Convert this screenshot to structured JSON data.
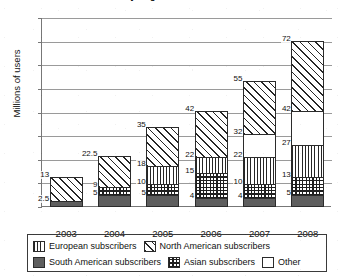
{
  "chart_data": {
    "type": "bar",
    "subtype": "stacked-bar",
    "title": "by Region 2003–2007",
    "xlabel": "",
    "ylabel": "Millions of users",
    "ylim": [
      0,
      80
    ],
    "ytick_step": 10,
    "ytick_labels": [
      "80",
      "70",
      "60",
      "50",
      "40",
      "30",
      "20",
      "10",
      "0"
    ],
    "grid": true,
    "legend_position": "bottom",
    "categories": [
      "2003",
      "2004",
      "2005",
      "2006",
      "2007",
      "2008"
    ],
    "series": [
      {
        "name": "South American subscribers",
        "pattern": "solid-dark-gray",
        "values": [
          2.5,
          5,
          5,
          4,
          4,
          5
        ]
      },
      {
        "name": "Asian subscribers",
        "pattern": "checkered",
        "values": [
          0,
          4,
          5,
          11,
          6,
          8
        ]
      },
      {
        "name": "European subscribers",
        "pattern": "vertical-stripes",
        "values": [
          0,
          0,
          8,
          7,
          12,
          14
        ]
      },
      {
        "name": "Other",
        "pattern": "white",
        "values": [
          0,
          0,
          0,
          0,
          10,
          15
        ]
      },
      {
        "name": "North American subscribers",
        "pattern": "diagonal-stripes",
        "values": [
          10.5,
          13.5,
          17,
          20,
          23,
          30
        ]
      }
    ],
    "cumulative_labels": [
      [
        "2.5",
        "13"
      ],
      [
        "5",
        "9",
        "22.5"
      ],
      [
        "5",
        "10",
        "18",
        "35"
      ],
      [
        "4",
        "15",
        "22",
        "42"
      ],
      [
        "4",
        "10",
        "22",
        "32",
        "55"
      ],
      [
        "5",
        "13",
        "27",
        "42",
        "72"
      ]
    ],
    "totals": [
      13,
      22.5,
      35,
      42,
      55,
      72
    ]
  },
  "legend": {
    "row1": [
      {
        "label": "European subscribers",
        "pattern": "vertical-stripes"
      },
      {
        "label": "North American subscribers",
        "pattern": "diagonal-stripes"
      }
    ],
    "row2": [
      {
        "label": "South American subscribers",
        "pattern": "solid-dark-gray"
      },
      {
        "label": "Asian subscribers",
        "pattern": "checkered"
      },
      {
        "label": "Other",
        "pattern": "white"
      }
    ]
  }
}
